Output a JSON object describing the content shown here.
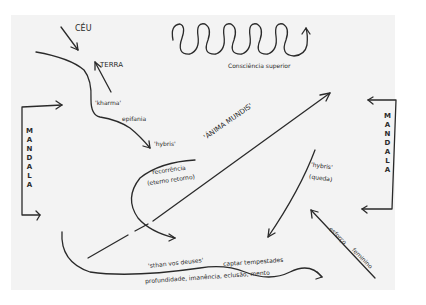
{
  "diagram": {
    "type": "hand-drawn sketch",
    "stroke_color": "#2a2a2a",
    "paper_color": "#f3f3f3",
    "labels": {
      "ceu": "CÉU",
      "terra": "TERRA",
      "kharma": "'kharma'",
      "epifania": "epifania",
      "hybris_top": "'hybris'",
      "consciencia_superior": "Consciência superior",
      "anima_mundis": "'ÁNIMA MUNDIS'",
      "recorrencia": "recorrência",
      "eterno_retorno": "(eterno retorno)",
      "hybris_right": "'hybris'",
      "queda": "(queda)",
      "esforco": "esforço",
      "feminino": "feminino",
      "mandala_left": "MANDALA",
      "mandala_right": "MANDALA",
      "sthan_vos_deuses": "'sthan vos deuses'",
      "captar_tempestades": "captar tempestades",
      "profundidade": "profundidade, imanência, eclusão, mento"
    },
    "mandala_left_letters": [
      "M",
      "A",
      "N",
      "D",
      "A",
      "L",
      "A"
    ],
    "mandala_right_letters": [
      "M",
      "A",
      "N",
      "D",
      "A",
      "L",
      "A"
    ]
  }
}
